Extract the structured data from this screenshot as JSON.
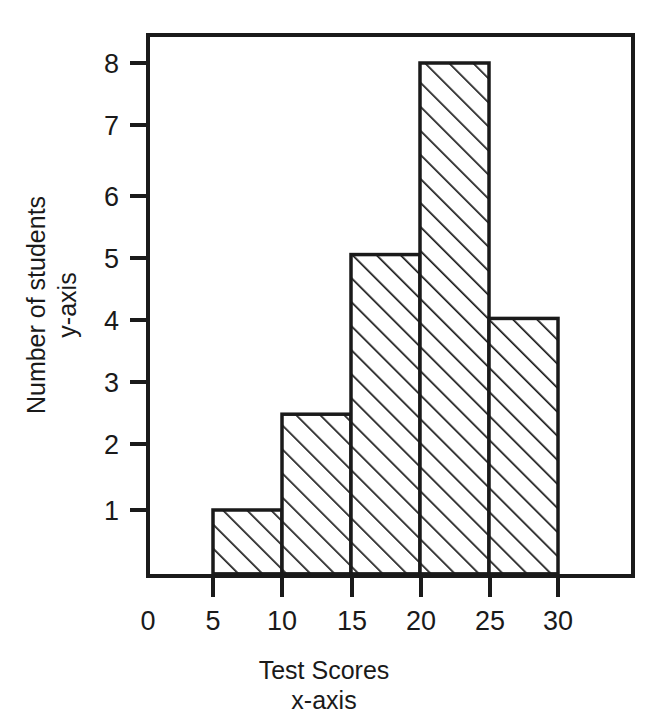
{
  "chart_data": {
    "type": "bar",
    "title": "",
    "subtitle": "",
    "xlabel": "Test Scores",
    "xlabel_sub": "x-axis",
    "ylabel": "Number of students",
    "ylabel_sub": "y-axis",
    "categories": [
      "5-10",
      "10-15",
      "15-20",
      "20-25",
      "25-30"
    ],
    "bin_edges": [
      5,
      10,
      15,
      20,
      25,
      30
    ],
    "values": [
      1,
      2.5,
      5,
      8,
      4
    ],
    "xlim": [
      0,
      35
    ],
    "ylim": [
      0,
      8.75
    ],
    "xticks": [
      0,
      5,
      10,
      15,
      20,
      25,
      30
    ],
    "xtick_labels": [
      "0",
      "5",
      "10",
      "15",
      "20",
      "25",
      "30"
    ],
    "yticks": [
      1,
      2,
      3,
      4,
      5,
      6,
      7,
      8
    ],
    "ytick_labels": [
      "1",
      "2",
      "3",
      "4",
      "5",
      "6",
      "7",
      "8"
    ],
    "grid": false,
    "legend": null,
    "bar_fill": "hatched-diagonal",
    "line_color": "#1a1a1a",
    "background_color": "#ffffff"
  },
  "axes": {
    "y_title_line1": "Number of students",
    "y_title_line2": "y-axis",
    "x_title_line1": "Test Scores",
    "x_title_line2": "x-axis"
  }
}
